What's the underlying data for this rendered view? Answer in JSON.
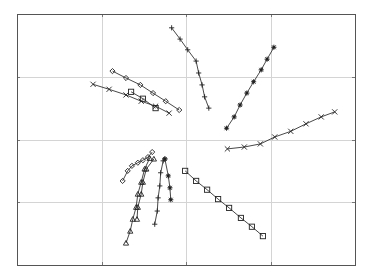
{
  "chart_data": {
    "type": "line",
    "title": "",
    "xlabel": "",
    "ylabel": "",
    "xlim": [
      0,
      4
    ],
    "ylim": [
      0,
      4
    ],
    "x_ticks": [
      1,
      2,
      3
    ],
    "y_ticks": [
      1,
      2,
      3
    ],
    "tick_labels_visible": false,
    "grid": true,
    "legend": null,
    "series": [
      {
        "name": "plus-top",
        "marker": "plus",
        "points": [
          [
            1.83,
            3.78
          ],
          [
            1.93,
            3.6
          ],
          [
            2.02,
            3.43
          ],
          [
            2.12,
            3.25
          ],
          [
            2.15,
            3.06
          ],
          [
            2.19,
            2.87
          ],
          [
            2.22,
            2.68
          ],
          [
            2.27,
            2.5
          ]
        ]
      },
      {
        "name": "asterisk-upper-right",
        "marker": "asterisk",
        "points": [
          [
            2.48,
            2.18
          ],
          [
            2.57,
            2.36
          ],
          [
            2.64,
            2.55
          ],
          [
            2.72,
            2.74
          ],
          [
            2.8,
            2.92
          ],
          [
            2.89,
            3.11
          ],
          [
            2.96,
            3.28
          ],
          [
            3.04,
            3.47
          ]
        ]
      },
      {
        "name": "x-right",
        "marker": "x",
        "points": [
          [
            2.49,
            1.85
          ],
          [
            2.69,
            1.88
          ],
          [
            2.88,
            1.93
          ],
          [
            3.05,
            2.04
          ],
          [
            3.24,
            2.13
          ],
          [
            3.42,
            2.25
          ],
          [
            3.6,
            2.36
          ],
          [
            3.76,
            2.44
          ]
        ]
      },
      {
        "name": "diamond-upper-left",
        "marker": "diamond",
        "points": [
          [
            1.13,
            3.09
          ],
          [
            1.29,
            2.98
          ],
          [
            1.46,
            2.87
          ],
          [
            1.61,
            2.74
          ],
          [
            1.76,
            2.61
          ],
          [
            1.92,
            2.47
          ]
        ]
      },
      {
        "name": "x-upper-left",
        "marker": "x",
        "points": [
          [
            0.9,
            2.88
          ],
          [
            1.09,
            2.8
          ],
          [
            1.29,
            2.71
          ],
          [
            1.47,
            2.61
          ],
          [
            1.64,
            2.53
          ],
          [
            1.8,
            2.42
          ]
        ]
      },
      {
        "name": "square-upper-left",
        "marker": "square",
        "points": [
          [
            1.35,
            2.76
          ],
          [
            1.49,
            2.65
          ],
          [
            1.64,
            2.5
          ]
        ]
      },
      {
        "name": "diamond-lower-left",
        "marker": "diamond",
        "points": [
          [
            1.25,
            1.34
          ],
          [
            1.31,
            1.5
          ],
          [
            1.36,
            1.58
          ],
          [
            1.43,
            1.63
          ],
          [
            1.49,
            1.67
          ],
          [
            1.55,
            1.72
          ],
          [
            1.6,
            1.8
          ]
        ]
      },
      {
        "name": "triangle-a",
        "marker": "triangle",
        "points": [
          [
            1.29,
            0.35
          ],
          [
            1.34,
            0.54
          ],
          [
            1.37,
            0.73
          ],
          [
            1.41,
            0.92
          ],
          [
            1.43,
            1.13
          ],
          [
            1.47,
            1.32
          ],
          [
            1.51,
            1.53
          ],
          [
            1.57,
            1.7
          ]
        ]
      },
      {
        "name": "triangle-b",
        "marker": "triangle",
        "points": [
          [
            1.62,
            1.69
          ],
          [
            1.53,
            1.53
          ],
          [
            1.49,
            1.32
          ],
          [
            1.47,
            1.13
          ],
          [
            1.43,
            0.92
          ],
          [
            1.42,
            0.73
          ]
        ]
      },
      {
        "name": "plus-lower",
        "marker": "plus",
        "points": [
          [
            1.63,
            0.65
          ],
          [
            1.66,
            0.86
          ],
          [
            1.67,
            1.07
          ],
          [
            1.69,
            1.26
          ],
          [
            1.7,
            1.47
          ],
          [
            1.73,
            1.66
          ],
          [
            1.75,
            1.69
          ]
        ]
      },
      {
        "name": "asterisk-lower",
        "marker": "asterisk",
        "points": [
          [
            1.75,
            1.69
          ],
          [
            1.79,
            1.42
          ],
          [
            1.81,
            1.23
          ],
          [
            1.82,
            1.04
          ]
        ]
      },
      {
        "name": "square-lower-right",
        "marker": "square",
        "points": [
          [
            1.99,
            1.5
          ],
          [
            2.12,
            1.34
          ],
          [
            2.25,
            1.2
          ],
          [
            2.38,
            1.05
          ],
          [
            2.51,
            0.91
          ],
          [
            2.65,
            0.75
          ],
          [
            2.78,
            0.61
          ],
          [
            2.91,
            0.46
          ]
        ]
      }
    ]
  },
  "layout": {
    "plot_left": 17,
    "plot_top": 14,
    "plot_right": 355,
    "plot_bottom": 265
  },
  "colors": {
    "frame": "#555555",
    "grid": "#d4d4d4",
    "series": "#333333",
    "background": "#ffffff"
  }
}
